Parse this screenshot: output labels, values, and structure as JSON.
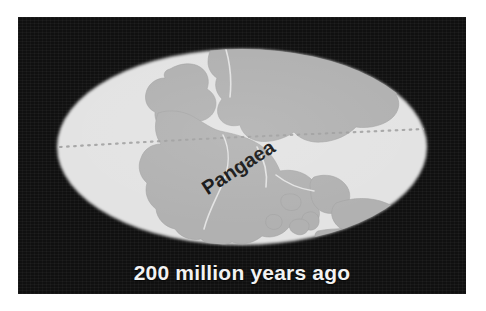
{
  "figure": {
    "caption": "200 million years ago",
    "continent_label": "Pangaea"
  },
  "colors": {
    "page_background": "#ffffff",
    "panel_background": "#101010",
    "ocean": "#e3e3e3",
    "landmass": "#b1b1b1",
    "landmass_outline": "#9a9a9a",
    "graticule": "#c9c9c9",
    "caption_text": "#f2f2f2",
    "label_text": "#131313"
  },
  "map": {
    "projection": "mollweide-ellipse",
    "ellipse": {
      "cx": 224,
      "cy": 130,
      "rx": 185,
      "ry": 98
    },
    "equator_label": "equator",
    "equator_style": "dotted",
    "landmass_name": "Pangaea",
    "landmass_label_rotation_deg": -33
  }
}
